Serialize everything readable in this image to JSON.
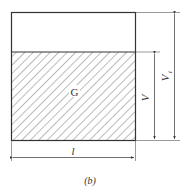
{
  "diagram": {
    "region_label": "G",
    "height_label": "V",
    "total_height_label": "V",
    "total_height_subscript": "t",
    "width_label": "l",
    "caption": "(b)",
    "colors": {
      "line": "#333333",
      "hatch": "#555555",
      "background": "#ffffff"
    }
  }
}
